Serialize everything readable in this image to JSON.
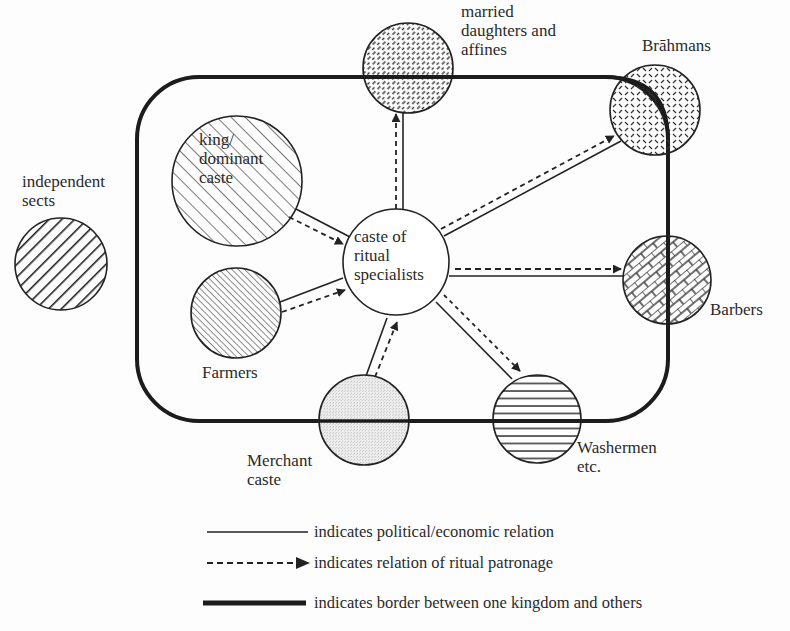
{
  "diagram": {
    "type": "network",
    "nodes": [
      {
        "id": "married",
        "label_lines": [
          "married",
          "daughters and",
          "affines"
        ],
        "pattern": "dense-dashed-diagonal"
      },
      {
        "id": "brahmans",
        "label_lines": [
          "Brāhmans"
        ],
        "pattern": "crosshatch-dashes"
      },
      {
        "id": "king",
        "label_lines": [
          "king/",
          "dominant",
          "caste"
        ],
        "pattern": "wide-diagonal-hatch"
      },
      {
        "id": "sects",
        "label_lines": [
          "independent",
          "sects"
        ],
        "pattern": "thick-diagonal-stripes"
      },
      {
        "id": "center",
        "label_lines": [
          "caste of",
          "ritual",
          "specialists"
        ],
        "pattern": "none"
      },
      {
        "id": "farmers",
        "label_lines": [
          "Farmers"
        ],
        "pattern": "fine-diagonal-hatch"
      },
      {
        "id": "barbers",
        "label_lines": [
          "Barbers"
        ],
        "pattern": "brick"
      },
      {
        "id": "merchant",
        "label_lines": [
          "Merchant",
          "caste"
        ],
        "pattern": "light-stipple"
      },
      {
        "id": "washermen",
        "label_lines": [
          "Washermen",
          "etc."
        ],
        "pattern": "horizontal-lines"
      }
    ],
    "edges": [
      {
        "from": "king",
        "to": "center",
        "political": true,
        "ritual": true
      },
      {
        "from": "farmers",
        "to": "center",
        "political": true,
        "ritual": true
      },
      {
        "from": "merchant",
        "to": "center",
        "political": true,
        "ritual": true
      },
      {
        "from": "center",
        "to": "married",
        "political": true,
        "ritual": true
      },
      {
        "from": "center",
        "to": "brahmans",
        "political": true,
        "ritual": true
      },
      {
        "from": "center",
        "to": "barbers",
        "political": true,
        "ritual": true
      },
      {
        "from": "center",
        "to": "washermen",
        "political": true,
        "ritual": true
      }
    ],
    "border": "kingdom border (rounded rectangle)"
  },
  "labels": {
    "married": [
      "married",
      "daughters and",
      "affines"
    ],
    "brahmans": "Brāhmans",
    "king": [
      "king/",
      "dominant",
      "caste"
    ],
    "sects": [
      "independent",
      "sects"
    ],
    "center": [
      "caste of",
      "ritual",
      "specialists"
    ],
    "farmers": "Farmers",
    "barbers": "Barbers",
    "merchant": [
      "Merchant",
      "caste"
    ],
    "washermen": [
      "Washermen",
      "etc."
    ]
  },
  "legend": {
    "political": "indicates political/economic relation",
    "ritual": "indicates relation of ritual patronage",
    "border": "indicates border between one kingdom and others"
  }
}
